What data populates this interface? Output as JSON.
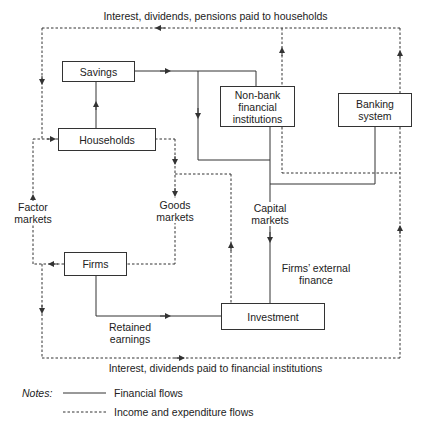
{
  "diagram": {
    "top_flow_label": "Interest, dividends, pensions paid to households",
    "bottom_flow_label": "Interest, dividends paid to financial institutions",
    "nodes": {
      "savings": "Savings",
      "households": "Households",
      "non_bank_line1": "Non-bank",
      "non_bank_line2": "financial",
      "non_bank_line3": "institutions",
      "banking_line1": "Banking",
      "banking_line2": "system",
      "firms": "Firms",
      "investment": "Investment"
    },
    "labels": {
      "factor_markets_line1": "Factor",
      "factor_markets_line2": "markets",
      "goods_markets_line1": "Goods",
      "goods_markets_line2": "markets",
      "capital_markets_line1": "Capital",
      "capital_markets_line2": "markets",
      "external_finance_line1": "Firms’ external",
      "external_finance_line2": "finance",
      "retained_line1": "Retained",
      "retained_line2": "earnings"
    },
    "legend": {
      "title": "Notes:",
      "solid": "Financial flows",
      "dashed": "Income and expenditure flows"
    },
    "colors": {
      "line": "#333333",
      "text": "#222222",
      "background": "#ffffff"
    }
  }
}
